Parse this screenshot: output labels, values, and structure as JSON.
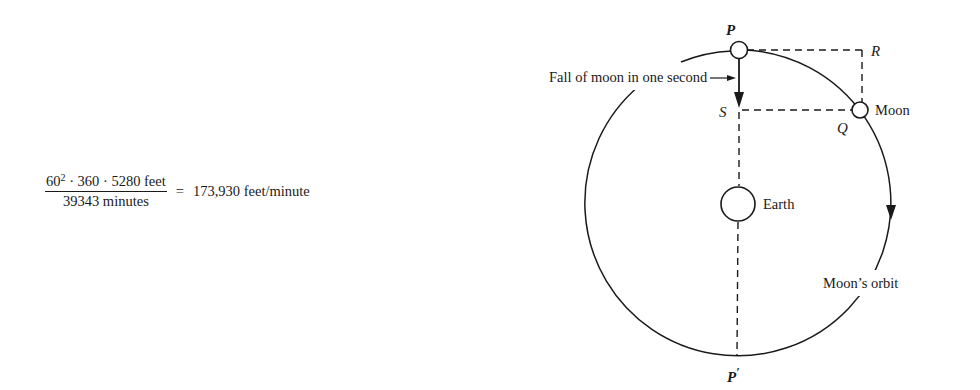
{
  "equation": {
    "numerator_base": "60",
    "numerator_exponent": "2",
    "numerator_rest": " · 360 · 5280 feet",
    "denominator": "39343 minutes",
    "equals": "=",
    "result": "173,930 feet/minute"
  },
  "diagram": {
    "labels": {
      "P": "P",
      "R": "R",
      "S": "S",
      "Q": "Q",
      "P_prime": "P",
      "P_prime_mark": "′",
      "moon": "Moon",
      "earth": "Earth",
      "orbit": "Moon’s orbit",
      "fall": "Fall of moon in one second"
    },
    "colors": {
      "ink": "#1a1a1a",
      "background": "#ffffff"
    }
  }
}
